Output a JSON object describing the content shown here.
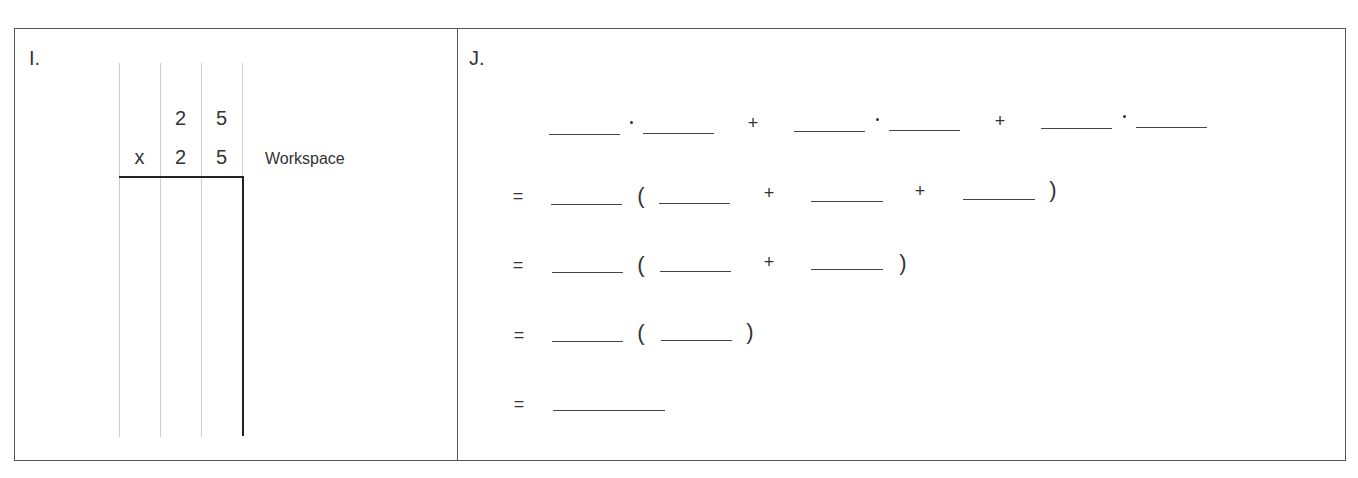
{
  "problem_i": {
    "label": "I.",
    "multiplication": {
      "operator": "x",
      "top_digits": [
        "2",
        "5"
      ],
      "bottom_digits": [
        "2",
        "5"
      ]
    },
    "workspace_label": "Workspace"
  },
  "problem_j": {
    "label": "J.",
    "rows": [
      {
        "lead": "",
        "tokens": [
          "blank",
          "·",
          "blank",
          "+",
          "blank",
          "·",
          "blank",
          "+",
          "blank",
          "·",
          "blank"
        ]
      },
      {
        "lead": "=",
        "tokens": [
          "blank",
          "(",
          "blank",
          "+",
          "blank",
          "+",
          "blank",
          ")"
        ]
      },
      {
        "lead": "=",
        "tokens": [
          "blank",
          "(",
          "blank",
          "+",
          "blank",
          ")"
        ]
      },
      {
        "lead": "=",
        "tokens": [
          "blank",
          "(",
          "blank",
          ")"
        ]
      },
      {
        "lead": "=",
        "tokens": [
          "long-blank"
        ]
      }
    ],
    "symbols": {
      "equals": "=",
      "plus": "+",
      "open_paren": "(",
      "close_paren": ")"
    }
  }
}
